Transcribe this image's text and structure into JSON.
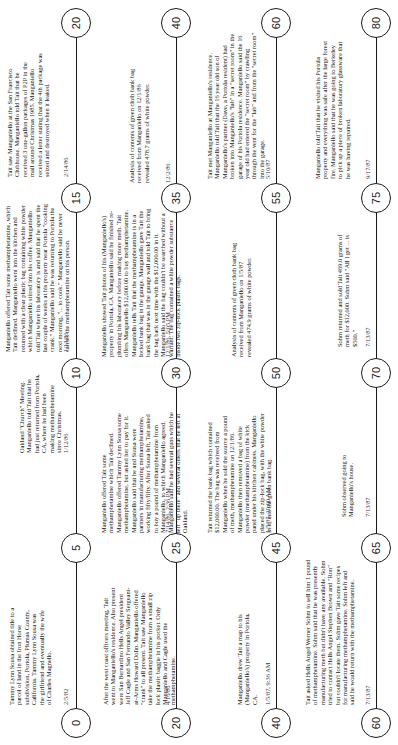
{
  "document": {
    "orientation": "rotated-90-ccw",
    "type": "timeline"
  },
  "rows": [
    {
      "ticks": [
        "0",
        "5",
        "10",
        "15",
        "20"
      ],
      "events": [
        {
          "text": "Tammy Lynn Sousa obtained title to a parcel of land in the Iron Horse subdivision, Portola, Plumas County, California. Tammy Lynn Sousa was the girlfriend and eventually the wife of Charles Magnello.",
          "date": "2/5/82"
        },
        {
          "text": "Oakland \"Church\" Meeting. Manganiello told Tait that he had just returned from Portola, CA, where he had been making methamphetamine since Christmas.",
          "date": "1/12/86"
        },
        {
          "text": "Manganiello offered Tait some methamphetamine, which Tait declined. Manganiello went into the kitchen and returned with a clear plastic bag containing white powder which Manganiello stirred into his coffee. Manganiello told Tait where his laboratory is and said that he spent the last couple of weeks at his property near Portola \"cooking crank.\" Manganiello said he was returning to Portola the next morning, \"... to cook.\" Manganiello said he never carries the methamphetamine on his person.",
          "date": "1/13/86"
        },
        {
          "text": "Tait saw Manganiello at the San Francisco Clubhouse. Manganiello told Tait that he received 3 one-gallon packages of P2P in the mail around Christmas 1985. Manganiello received a letter stating that the 4th package was seized and destroyed when it leaked.",
          "date": "2/14/86"
        }
      ]
    },
    {
      "ticks": [
        "20",
        "25",
        "30",
        "35",
        "40"
      ],
      "events": [
        {
          "text": "After the west coast officers meeting, Tait went to Manganiello's residence. Also present were San Bernardino Hells Angel president Jeff Cagle and San Fernando Valley Sergeant-at-Arms Howard Dolin. Manganiello offered \"crank\" to all present. Tait saw Manganiello take the methamphetamine from a small zip lock plastic baggie in his pocket. Only Manganiello and Cagle used the methamphetamine.",
          "date": "4/16/86"
        },
        {
          "text": "Manganiello offered Tait some methamphetamine which Tait declined. Manganiello offered Tammy Lynn Sousa some methamphetamine, but asked her to pay for it. Manganiello said that he and Sousa were partners in manufacturing methamphetamine, working fifty/fifty. After Sousa left, Tait asked to buy a pound of methamphetamine from Manganiello, to which Manganiello agreed. Manganiello said he had several guns which he left \"up there\" and several others that he left in Oakland.",
          "date": "7/14/86, 2:36 PM"
        },
        {
          "text": "Manganiello showed Tait photos of his (Manganiello's) property in Portola, CA. Manganiello said he finished re-plumbing his laboratory before making more meth. Tait offers Manganiello $12,000.00 to buy methamphetamine. Manganiello tells Tait that the methamphetamine is in a locked bank bag in the garage. Manganiello gave Tait the bank bag that was in the garage wall and told Tait to bring the bag back next time with the $12,000.00 in it. Manganiello said the bag couldn't be searched without a warrant. The bag contained a white powder substance inside two zip-lock plastic bags.",
          "date": "12/1/86, 5:05 PM"
        },
        {
          "text": "Analysis of contents of green cloth bank bag received from Manganiello on 12/1/86 revealed 478.7 grams of white powder.",
          "date": "12/2/86"
        }
      ]
    },
    {
      "ticks": [
        "40",
        "45",
        "50",
        "55",
        "60"
      ],
      "events": [
        {
          "text": "Manganiello drew Tait a map to his (Manganiello's) property in Portola, CA.",
          "date": "1/5/87, 9:36 AM"
        },
        {
          "text": "Tait returned the bank bag which contained $12,000.00. The bag was received from Manganiello when he sold the source a pound of meth, methamphetamine on 12/1/86. Manganiello then removed a bag of white powder (methamphetamine) from the kick panel under his kitchen cabinets. Manganiello placed the zip-lock bag, with the white powder in it, into the green bank bag.",
          "date": "1/5/87, 10:00 AM"
        },
        {
          "text": "Analysis of contents of green cloth bank bag received from Manganiello on 1/5/87 revealed 474.9 grams of white powder.",
          "date": ""
        },
        {
          "text": "Tait met Manganiello at Manganiello's residence. Manganiello told Tait that the 16 year old son of Manganiello's partner (Dave, a Portola resident) had broken into Manganiello's \"lab\" in a \"secret room\" in the garage of his Portola residence. Manganiello said the 16 year old had entered the \"secret room\" by crawling through the vent for the \"lab\" and from the \"secret room\" into the garage.",
          "date": "5/10/87"
        }
      ]
    },
    {
      "ticks": [
        "60",
        "65",
        "70",
        "75",
        "80"
      ],
      "events": [
        {
          "text": "Tait asked Hells Angel Werner Sohm to sell him 1 pound of methamphetamine. Sohm said that he was presently manufacturing meth but didn't have any available. Sohm tried to contact Hells Angel Stephen Brown and \"Ron\" but couldn't locate them. Sohm gave Tait some recipes for manufacturing methamphetamine. Sohm left and said he would return with the methamphetamine.",
          "date": "7/13/87"
        },
        {
          "text": "Sohm observed going to Manganiello's house.",
          "date": "7/13/87"
        },
        {
          "text": "Sohm returned and sold Tait 469.0 grams of meth for $12,000. Sohm said \"All I get ... is $500.\"",
          "date": "7/13/87"
        },
        {
          "text": "Manganiello told Tait that he visited his Portola property and everything was safe after the large forest fire. Manganiello said that he was going to Berkeley to pick up a piece of broken laboratory glassware that he was having repaired.",
          "date": "9/17/87"
        }
      ]
    }
  ]
}
